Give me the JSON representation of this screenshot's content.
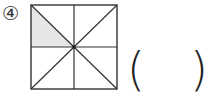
{
  "problem": {
    "number_label": "④",
    "answer_open": "(",
    "answer_close": ")",
    "answer_value": ""
  },
  "figure": {
    "shape": "square",
    "divisions": 8,
    "shaded_parts": 1,
    "total_parts": 8,
    "shade_color": "#e6e6e6",
    "line_color": "#333333"
  }
}
